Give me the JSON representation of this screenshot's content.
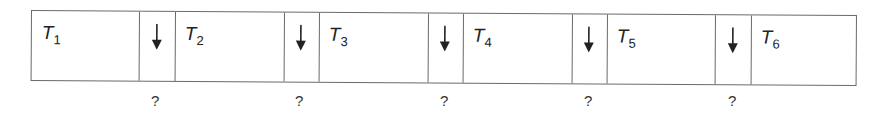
{
  "diagram": {
    "type": "timeline-strip",
    "tasks": [
      {
        "name": "T",
        "sub": "1"
      },
      {
        "name": "T",
        "sub": "2"
      },
      {
        "name": "T",
        "sub": "3"
      },
      {
        "name": "T",
        "sub": "4"
      },
      {
        "name": "T",
        "sub": "5"
      },
      {
        "name": "T",
        "sub": "6"
      }
    ],
    "gaps": [
      {
        "symbol": "?",
        "arrow": "down-arrow"
      },
      {
        "symbol": "?",
        "arrow": "down-arrow"
      },
      {
        "symbol": "?",
        "arrow": "down-arrow"
      },
      {
        "symbol": "?",
        "arrow": "down-arrow"
      },
      {
        "symbol": "?",
        "arrow": "down-arrow"
      }
    ],
    "line_color": "#6a6a6a",
    "text_color": "#222222"
  }
}
